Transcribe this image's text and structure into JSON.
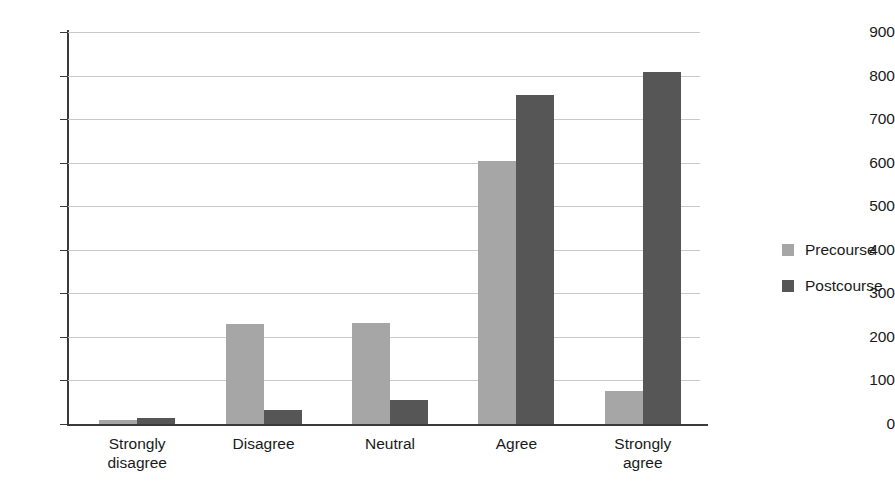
{
  "chart_data": {
    "type": "bar",
    "title": "",
    "xlabel": "",
    "ylabel": "",
    "ylim": [
      0,
      900
    ],
    "ytick_step": 100,
    "yticks": [
      900,
      800,
      700,
      600,
      500,
      400,
      300,
      200,
      100,
      0
    ],
    "grid": true,
    "legend_position": "right",
    "categories": [
      "Strongly disagree",
      "Disagree",
      "Neutral",
      "Agree",
      "Strongly agree"
    ],
    "category_lines": [
      [
        "Strongly",
        "disagree"
      ],
      [
        "Disagree"
      ],
      [
        "Neutral"
      ],
      [
        "Agree"
      ],
      [
        "Strongly",
        "agree"
      ]
    ],
    "series": [
      {
        "name": "Precourse",
        "color": "#a6a6a6",
        "values": [
          10,
          230,
          233,
          605,
          76
        ]
      },
      {
        "name": "Postcourse",
        "color": "#565656",
        "values": [
          13,
          32,
          55,
          756,
          808
        ]
      }
    ]
  },
  "legend": {
    "items": [
      {
        "label": "Precourse",
        "swatch": "legend-swatch-precourse"
      },
      {
        "label": "Postcourse",
        "swatch": "legend-swatch-postcourse"
      }
    ]
  }
}
